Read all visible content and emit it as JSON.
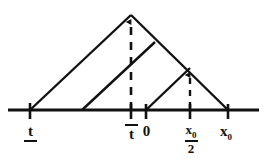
{
  "figure": {
    "kind": "geometry-diagram",
    "colors": {
      "ink": "#111111",
      "background": "#ffffff"
    },
    "axis": {
      "y": 110,
      "x_start": 8,
      "x_end": 259,
      "stroke_width": 3,
      "ticks": [
        {
          "id": "t-lower",
          "x": 30,
          "label": "t",
          "style": "underline"
        },
        {
          "id": "t-upper",
          "x": 131,
          "label": "t",
          "style": "overline"
        },
        {
          "id": "zero",
          "x": 146,
          "label": "0",
          "style": "plain"
        },
        {
          "id": "x0-half",
          "x": 190,
          "label_numerator": "x",
          "label_numerator_sub": "0",
          "label_denominator": "2",
          "style": "fraction"
        },
        {
          "id": "x0",
          "x": 228,
          "label": "x",
          "label_sub": "0",
          "style": "subscript"
        }
      ]
    },
    "shapes": {
      "big_triangle": {
        "name": "large-triangle",
        "left_base": {
          "x": 30,
          "y": 110
        },
        "apex": {
          "x": 131,
          "y": 15
        },
        "right_base": {
          "x": 228,
          "y": 110
        }
      },
      "middle_ramp": {
        "name": "middle-ramp",
        "base": {
          "x": 82,
          "y": 110
        },
        "top": {
          "x": 155,
          "y": 42
        }
      },
      "small_triangle": {
        "name": "small-triangle",
        "base": {
          "x": 146,
          "y": 110
        },
        "apex": {
          "x": 190,
          "y": 68
        }
      }
    },
    "dashed_arrows": [
      {
        "id": "apex-height-marker",
        "x": 131,
        "y_bottom": 110,
        "y_top": 17
      },
      {
        "id": "small-apex-height-marker",
        "x": 190,
        "y_bottom": 110,
        "y_top": 70
      }
    ]
  }
}
